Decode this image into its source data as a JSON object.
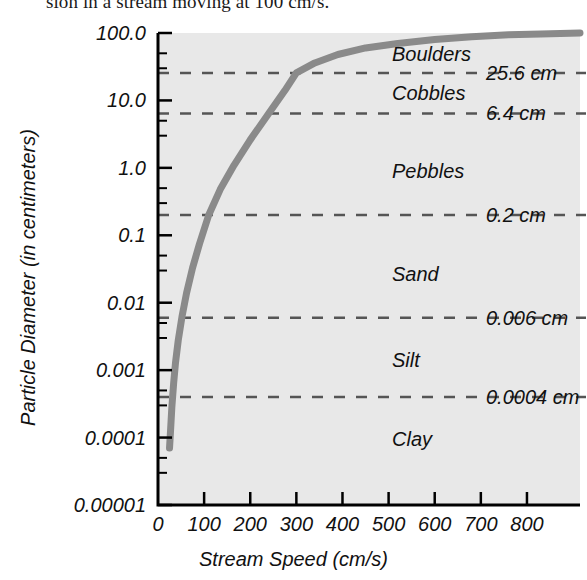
{
  "caption": {
    "text": "sion in a stream moving at 100 cm/s."
  },
  "chart_data": {
    "type": "line",
    "title": "",
    "xlabel": "Stream Speed (cm/s)",
    "ylabel": "Particle Diameter (in centimeters)",
    "xlim": [
      0,
      915
    ],
    "ylim": [
      1e-05,
      100.0
    ],
    "yscale": "log",
    "xscale": "linear",
    "grid": false,
    "legend": null,
    "xticks": [
      0,
      100,
      200,
      300,
      400,
      500,
      600,
      700,
      800
    ],
    "xtick_labels": [
      "0",
      "100",
      "200",
      "300",
      "400",
      "500",
      "600",
      "700",
      "800"
    ],
    "yticks": [
      100.0,
      10.0,
      1.0,
      0.1,
      0.01,
      0.001,
      0.0001,
      1e-05
    ],
    "ytick_labels": [
      "100.0",
      "10.0",
      "1.0",
      "0.1",
      "0.01",
      "0.001",
      "0.0001",
      "0.00001"
    ],
    "series": [
      {
        "name": "Competence curve",
        "color": "#8a8a8a",
        "x": [
          25,
          27,
          30,
          34,
          38,
          44,
          52,
          62,
          75,
          90,
          110,
          135,
          165,
          200,
          240,
          275,
          300,
          340,
          390,
          450,
          520,
          600,
          680,
          760,
          830,
          915
        ],
        "y": [
          7e-05,
          0.00012,
          0.00028,
          0.00065,
          0.0013,
          0.0028,
          0.0062,
          0.014,
          0.033,
          0.075,
          0.2,
          0.48,
          1.1,
          2.6,
          6.4,
          14.0,
          25.6,
          36.0,
          48.0,
          60.0,
          70.0,
          80.0,
          88.0,
          94.0,
          97.0,
          100.0
        ]
      }
    ],
    "threshold_lines": [
      {
        "label": "25.6 cm",
        "value": 25.6
      },
      {
        "label": "6.4 cm",
        "value": 6.4
      },
      {
        "label": "0.2 cm",
        "value": 0.2
      },
      {
        "label": "0.006 cm",
        "value": 0.006
      },
      {
        "label": "0.0004 cm",
        "value": 0.0004
      }
    ],
    "category_labels": [
      {
        "label": "Boulders",
        "y": 45.0
      },
      {
        "label": "Cobbles",
        "y": 12.0
      },
      {
        "label": "Pebbles",
        "y": 0.85
      },
      {
        "label": "Sand",
        "y": 0.025
      },
      {
        "label": "Silt",
        "y": 0.0013
      },
      {
        "label": "Clay",
        "y": 9e-05
      }
    ],
    "style": {
      "plot_background": "#e8e8e8",
      "axis_color": "#000000",
      "curve_color": "#8a8a8a",
      "dash_color": "#555555",
      "text_color": "#111111"
    }
  }
}
